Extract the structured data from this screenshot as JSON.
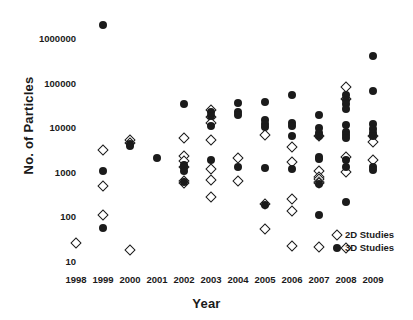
{
  "chart_data": {
    "type": "scatter",
    "title": "",
    "xlabel": "Year",
    "ylabel": "No. of Particles",
    "yscale": "log",
    "ylim": [
      10,
      3000000
    ],
    "ytick_labels": [
      "1000000",
      "100000",
      "10000",
      "1000",
      "100",
      "10"
    ],
    "ytick_values": [
      1000000,
      100000,
      10000,
      1000,
      100,
      10
    ],
    "xtick_labels": [
      "1998",
      "1999",
      "2000",
      "2001",
      "2002",
      "2003",
      "2004",
      "2005",
      "2006",
      "2007",
      "2008",
      "2009"
    ],
    "xlim": [
      1997.5,
      2009.5
    ],
    "grid": false,
    "legend_position": "lower-right",
    "marker_color": "#1b1b1b",
    "series": [
      {
        "name": "2D Studies",
        "marker": "open-diamond",
        "points": [
          {
            "x": 1998,
            "y": 25
          },
          {
            "x": 1999,
            "y": 3100
          },
          {
            "x": 1999,
            "y": 480
          },
          {
            "x": 1999,
            "y": 105
          },
          {
            "x": 2000,
            "y": 5200
          },
          {
            "x": 2000,
            "y": 4400
          },
          {
            "x": 2000,
            "y": 18
          },
          {
            "x": 2002,
            "y": 5800
          },
          {
            "x": 2002,
            "y": 2300
          },
          {
            "x": 2002,
            "y": 1750
          },
          {
            "x": 2002,
            "y": 1300
          },
          {
            "x": 2002,
            "y": 620
          },
          {
            "x": 2002,
            "y": 560
          },
          {
            "x": 2003,
            "y": 24000
          },
          {
            "x": 2003,
            "y": 17000
          },
          {
            "x": 2003,
            "y": 12500
          },
          {
            "x": 2003,
            "y": 5200
          },
          {
            "x": 2003,
            "y": 1150
          },
          {
            "x": 2003,
            "y": 650
          },
          {
            "x": 2003,
            "y": 270
          },
          {
            "x": 2004,
            "y": 2050
          },
          {
            "x": 2004,
            "y": 620
          },
          {
            "x": 2005,
            "y": 6700
          },
          {
            "x": 2005,
            "y": 190
          },
          {
            "x": 2005,
            "y": 52
          },
          {
            "x": 2006,
            "y": 3600
          },
          {
            "x": 2006,
            "y": 1650
          },
          {
            "x": 2006,
            "y": 240
          },
          {
            "x": 2006,
            "y": 130
          },
          {
            "x": 2006,
            "y": 22
          },
          {
            "x": 2007,
            "y": 6400
          },
          {
            "x": 2007,
            "y": 1050
          },
          {
            "x": 2007,
            "y": 780
          },
          {
            "x": 2007,
            "y": 680
          },
          {
            "x": 2007,
            "y": 600
          },
          {
            "x": 2007,
            "y": 560
          },
          {
            "x": 2007,
            "y": 21
          },
          {
            "x": 2008,
            "y": 80000
          },
          {
            "x": 2008,
            "y": 43000
          },
          {
            "x": 2008,
            "y": 2100
          },
          {
            "x": 2008,
            "y": 1000
          },
          {
            "x": 2008,
            "y": 20
          },
          {
            "x": 2009,
            "y": 6500
          },
          {
            "x": 2009,
            "y": 4700
          },
          {
            "x": 2009,
            "y": 1800
          }
        ]
      },
      {
        "name": "3D Studies",
        "marker": "filled-circle",
        "points": [
          {
            "x": 1999,
            "y": 2000000
          },
          {
            "x": 1999,
            "y": 1050
          },
          {
            "x": 1999,
            "y": 55
          },
          {
            "x": 2000,
            "y": 4100
          },
          {
            "x": 2000,
            "y": 3800
          },
          {
            "x": 2001,
            "y": 2050
          },
          {
            "x": 2002,
            "y": 33000
          },
          {
            "x": 2002,
            "y": 1450
          },
          {
            "x": 2002,
            "y": 1250
          },
          {
            "x": 2002,
            "y": 1050
          },
          {
            "x": 2002,
            "y": 600
          },
          {
            "x": 2003,
            "y": 22000
          },
          {
            "x": 2003,
            "y": 18000
          },
          {
            "x": 2003,
            "y": 10500
          },
          {
            "x": 2003,
            "y": 1800
          },
          {
            "x": 2004,
            "y": 35000
          },
          {
            "x": 2004,
            "y": 22000
          },
          {
            "x": 2004,
            "y": 19000
          },
          {
            "x": 2004,
            "y": 1250
          },
          {
            "x": 2005,
            "y": 37000
          },
          {
            "x": 2005,
            "y": 14500
          },
          {
            "x": 2005,
            "y": 11500
          },
          {
            "x": 2005,
            "y": 10000
          },
          {
            "x": 2005,
            "y": 1200
          },
          {
            "x": 2005,
            "y": 180
          },
          {
            "x": 2006,
            "y": 52000
          },
          {
            "x": 2006,
            "y": 12500
          },
          {
            "x": 2006,
            "y": 10500
          },
          {
            "x": 2006,
            "y": 6200
          },
          {
            "x": 2006,
            "y": 1150
          },
          {
            "x": 2007,
            "y": 19000
          },
          {
            "x": 2007,
            "y": 9500
          },
          {
            "x": 2007,
            "y": 7500
          },
          {
            "x": 2007,
            "y": 6400
          },
          {
            "x": 2007,
            "y": 2100
          },
          {
            "x": 2007,
            "y": 1900
          },
          {
            "x": 2007,
            "y": 540
          },
          {
            "x": 2007,
            "y": 110
          },
          {
            "x": 2008,
            "y": 52000
          },
          {
            "x": 2008,
            "y": 40000
          },
          {
            "x": 2008,
            "y": 33000
          },
          {
            "x": 2008,
            "y": 25000
          },
          {
            "x": 2008,
            "y": 11000
          },
          {
            "x": 2008,
            "y": 8000
          },
          {
            "x": 2008,
            "y": 6600
          },
          {
            "x": 2008,
            "y": 5600
          },
          {
            "x": 2008,
            "y": 1800
          },
          {
            "x": 2008,
            "y": 1300
          },
          {
            "x": 2008,
            "y": 210
          },
          {
            "x": 2009,
            "y": 400000
          },
          {
            "x": 2009,
            "y": 66000
          },
          {
            "x": 2009,
            "y": 11500
          },
          {
            "x": 2009,
            "y": 9000
          },
          {
            "x": 2009,
            "y": 7500
          },
          {
            "x": 2009,
            "y": 6200
          },
          {
            "x": 2009,
            "y": 1300
          },
          {
            "x": 2009,
            "y": 1100
          }
        ]
      }
    ]
  },
  "legend": {
    "items": [
      {
        "label": "2D Studies",
        "marker": "open-diamond"
      },
      {
        "label": "3D Studies",
        "marker": "filled-circle"
      }
    ]
  }
}
